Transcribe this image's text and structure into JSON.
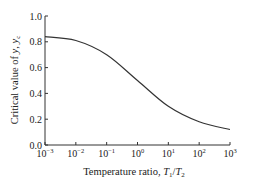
{
  "chart_data": {
    "type": "line",
    "title": "",
    "xlabel": "Temperature ratio, T1/T2",
    "ylabel": "Critical value of y, yc",
    "xscale": "log",
    "xlim": [
      0.001,
      1000
    ],
    "ylim": [
      0.0,
      1.0
    ],
    "grid": false,
    "legend": null,
    "x_ticks": [
      "10^-3",
      "10^-2",
      "10^-1",
      "10^0",
      "10^1",
      "10^2",
      "10^3"
    ],
    "y_ticks": [
      "0.0",
      "0.2",
      "0.4",
      "0.6",
      "0.8",
      "1.0"
    ],
    "series": [
      {
        "name": "yc",
        "x": [
          0.001,
          0.01,
          0.1,
          1,
          10,
          100,
          1000
        ],
        "values": [
          0.84,
          0.81,
          0.7,
          0.5,
          0.3,
          0.18,
          0.12
        ]
      }
    ]
  }
}
